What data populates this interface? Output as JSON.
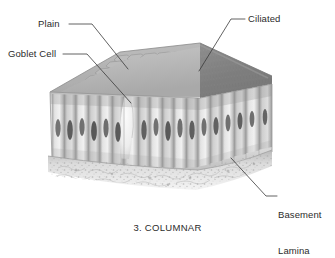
{
  "figure": {
    "caption": "3. COLUMNAR",
    "background_color": "#ffffff",
    "ink_color": "#2b2b2b"
  },
  "labels": [
    {
      "id": "plain",
      "text": "Plain",
      "name": "label-plain"
    },
    {
      "id": "goblet",
      "text": "Goblet Cell",
      "name": "label-goblet-cell"
    },
    {
      "id": "ciliated",
      "text": "Ciliated",
      "name": "label-ciliated"
    },
    {
      "id": "basement",
      "line1": "Basement",
      "line2": "Lamina",
      "name": "label-basement-lamina"
    }
  ],
  "leader_lines": [
    {
      "id": "plain",
      "from": "Plain label",
      "to": "plain apical surface mosaic"
    },
    {
      "id": "goblet",
      "from": "Goblet Cell label",
      "to": "goblet cell in columnar layer"
    },
    {
      "id": "ciliated",
      "from": "Ciliated label",
      "to": "ciliated apical surface"
    },
    {
      "id": "basement",
      "from": "Basement Lamina label",
      "to": "basement lamina band"
    }
  ],
  "illustration": {
    "regions": [
      {
        "name": "plain-surface",
        "description": "polygonal cell mosaic on left half of top face",
        "tone": "#b8b8b8"
      },
      {
        "name": "ciliated-surface",
        "description": "dense fuzzy cilia carpet on right half of top face",
        "tone": "#8e8e8e"
      },
      {
        "name": "columnar-cells",
        "description": "row of tall columnar cells with dark elongated nuclei",
        "tone": "#d2d2d2"
      },
      {
        "name": "goblet-cell",
        "description": "pale bulbous mucus-filled cell among columnar cells",
        "tone": "#ececec"
      },
      {
        "name": "basement-lamina",
        "description": "granular speckled band beneath the cell layer",
        "tone": "#cfcfcf"
      }
    ],
    "nuclei_count": 16,
    "columnar_cell_count": 17
  }
}
